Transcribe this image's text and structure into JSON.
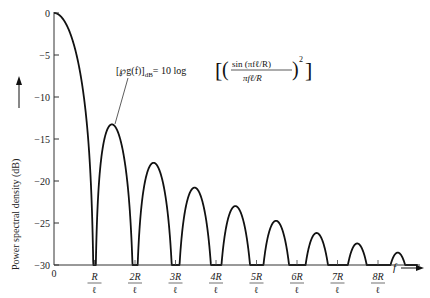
{
  "chart_data": {
    "type": "line",
    "title": "",
    "xlabel": "f",
    "ylabel": "Power spectral density (dB)",
    "ylim": [
      -30,
      0
    ],
    "xlim_units_of_R_over_l": [
      0,
      9
    ],
    "grid": false,
    "legend": null,
    "y_ticks": [
      0,
      -5,
      -10,
      -15,
      -20,
      -25,
      -30
    ],
    "y_tick_labels": [
      "0",
      "−5",
      "−10",
      "−15",
      "−20",
      "−25",
      "−30"
    ],
    "x_ticks": [
      0,
      1,
      2,
      3,
      4,
      5,
      6,
      7,
      8
    ],
    "x_tick_labels": [
      {
        "num": "0",
        "den": ""
      },
      {
        "num": "R",
        "den": "ℓ"
      },
      {
        "num": "2R",
        "den": "ℓ"
      },
      {
        "num": "3R",
        "den": "ℓ"
      },
      {
        "num": "4R",
        "den": "ℓ"
      },
      {
        "num": "5R",
        "den": "ℓ"
      },
      {
        "num": "6R",
        "den": "ℓ"
      },
      {
        "num": "7R",
        "den": "ℓ"
      },
      {
        "num": "8R",
        "den": "ℓ"
      }
    ],
    "series": [
      {
        "name": "sinc-squared PSD",
        "formula": "10 log[(sin(πfℓ/R)/(πfℓ/R))^2]",
        "main_lobe_peak_db": 0,
        "nulls_at_multiples_of_R_over_l": [
          1,
          2,
          3,
          4,
          5,
          6,
          7,
          8
        ],
        "sidelobe_peaks": [
          {
            "x": 1.43,
            "y": -13.3
          },
          {
            "x": 2.46,
            "y": -17.8
          },
          {
            "x": 3.47,
            "y": -20.8
          },
          {
            "x": 4.48,
            "y": -23.0
          },
          {
            "x": 5.48,
            "y": -24.7
          },
          {
            "x": 6.49,
            "y": -26.2
          },
          {
            "x": 7.49,
            "y": -27.4
          },
          {
            "x": 8.49,
            "y": -28.5
          }
        ]
      }
    ],
    "annotations": [
      {
        "text_lhs": "[℘g(f)]",
        "text_sub": "dB",
        "text_rhs": "= 10 log",
        "numerator": "sin (πfℓ/R)",
        "denominator": "πfℓ/R",
        "exponent": "2",
        "points_to": "first sidelobe"
      }
    ]
  },
  "axis": {
    "x_arrow_label": "f",
    "y_arrow_label": "Power spectral density (dB)"
  }
}
